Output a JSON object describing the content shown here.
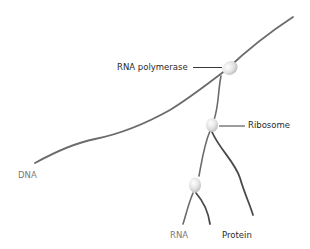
{
  "diagram": {
    "labels": {
      "rna_polymerase": "RNA polymerase",
      "ribosome": "Ribosome",
      "dna": "DNA",
      "rna": "RNA",
      "protein": "Protein"
    },
    "colors": {
      "strand": "#6b6b6b",
      "blob_fill": "#e4e4e4",
      "label_dark": "#2a2a2a",
      "label_gray": "#7a7a7a",
      "background": "#ffffff"
    }
  }
}
